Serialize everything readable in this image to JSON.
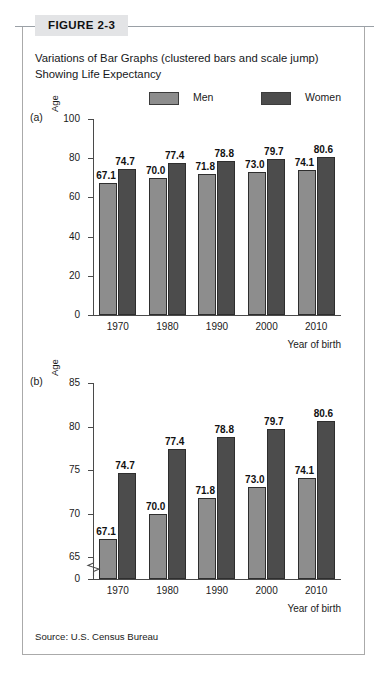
{
  "figure": {
    "number_label": "FIGURE 2-3",
    "title": "Variations of Bar Graphs (clustered bars and scale jump) Showing Life Expectancy",
    "source": "Source: U.S. Census Bureau"
  },
  "legend": {
    "men_label": "Men",
    "women_label": "Women",
    "men_color": "#8d8d8d",
    "women_color": "#4c4c4c"
  },
  "panels": {
    "a_label": "(a)",
    "b_label": "(b)"
  },
  "chart_data": [
    {
      "type": "bar",
      "panel": "(a)",
      "title": "",
      "xlabel": "Year of birth",
      "ylabel": "Age",
      "categories": [
        "1970",
        "1980",
        "1990",
        "2000",
        "2010"
      ],
      "series": [
        {
          "name": "Men",
          "color": "#8d8d8d",
          "values": [
            67.1,
            70.0,
            71.8,
            73.0,
            74.1
          ]
        },
        {
          "name": "Women",
          "color": "#4c4c4c",
          "values": [
            74.7,
            77.4,
            78.8,
            79.7,
            80.6
          ]
        }
      ],
      "ylim": [
        0,
        100
      ],
      "yticks": [
        0,
        20,
        40,
        60,
        80,
        100
      ],
      "grid": false,
      "axis_break": false,
      "legend_position": "top"
    },
    {
      "type": "bar",
      "panel": "(b)",
      "title": "",
      "xlabel": "Year of birth",
      "ylabel": "Age",
      "categories": [
        "1970",
        "1980",
        "1990",
        "2000",
        "2010"
      ],
      "series": [
        {
          "name": "Men",
          "color": "#8d8d8d",
          "values": [
            67.1,
            70.0,
            71.8,
            73.0,
            74.1
          ]
        },
        {
          "name": "Women",
          "color": "#4c4c4c",
          "values": [
            74.7,
            77.4,
            78.8,
            79.7,
            80.6
          ]
        }
      ],
      "ylim": [
        65,
        85
      ],
      "yticks": [
        0,
        65,
        70,
        75,
        80,
        85
      ],
      "grid": false,
      "axis_break": true,
      "axis_break_between": [
        0,
        65
      ],
      "legend_position": "top"
    }
  ]
}
